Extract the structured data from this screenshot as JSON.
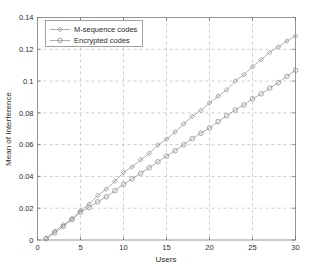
{
  "chart_data": {
    "type": "line",
    "title": "",
    "xlabel": "Users",
    "ylabel": "Mean of Interference",
    "xlim": [
      0,
      30
    ],
    "ylim": [
      0,
      0.14
    ],
    "grid": true,
    "legend_position": "top-left",
    "xticks": [
      "0",
      "5",
      "10",
      "15",
      "20",
      "25",
      "30"
    ],
    "xtick_values": [
      0,
      5,
      10,
      15,
      20,
      25,
      30
    ],
    "yticks": [
      "0",
      "0.02",
      "0.04",
      "0.06",
      "0.08",
      "0.1",
      "0.12",
      "0.14"
    ],
    "ytick_values": [
      0,
      0.02,
      0.04,
      0.06,
      0.08,
      0.1,
      0.12,
      0.14
    ],
    "x": [
      1,
      2,
      3,
      4,
      5,
      6,
      7,
      8,
      9,
      10,
      11,
      12,
      13,
      14,
      15,
      16,
      17,
      18,
      19,
      20,
      21,
      22,
      23,
      24,
      25,
      26,
      27,
      28,
      29,
      30
    ],
    "series": [
      {
        "name": "M-sequence codes",
        "marker": "diamond",
        "color": "#8a8a8a",
        "values": [
          0.0012,
          0.0055,
          0.0095,
          0.0135,
          0.0185,
          0.0225,
          0.028,
          0.032,
          0.037,
          0.0425,
          0.046,
          0.0505,
          0.0545,
          0.0598,
          0.0635,
          0.068,
          0.073,
          0.0778,
          0.0815,
          0.0862,
          0.0905,
          0.0945,
          0.1,
          0.104,
          0.109,
          0.1135,
          0.118,
          0.1215,
          0.1252,
          0.1285
        ]
      },
      {
        "name": "Encrypted codes",
        "marker": "circle",
        "color": "#9a9a9a",
        "values": [
          0.0008,
          0.0045,
          0.0085,
          0.0128,
          0.0175,
          0.0205,
          0.024,
          0.0272,
          0.031,
          0.035,
          0.0385,
          0.042,
          0.0455,
          0.0492,
          0.0528,
          0.0562,
          0.06,
          0.0638,
          0.0672,
          0.0705,
          0.0745,
          0.0782,
          0.0818,
          0.085,
          0.0888,
          0.092,
          0.0955,
          0.099,
          0.103,
          0.1068
        ]
      }
    ],
    "legend": [
      {
        "label": "M-sequence codes",
        "marker": "diamond"
      },
      {
        "label": "Encrypted codes",
        "marker": "circle"
      }
    ]
  },
  "axes": {
    "x_label": "Users",
    "y_label": "Mean of Interference"
  }
}
